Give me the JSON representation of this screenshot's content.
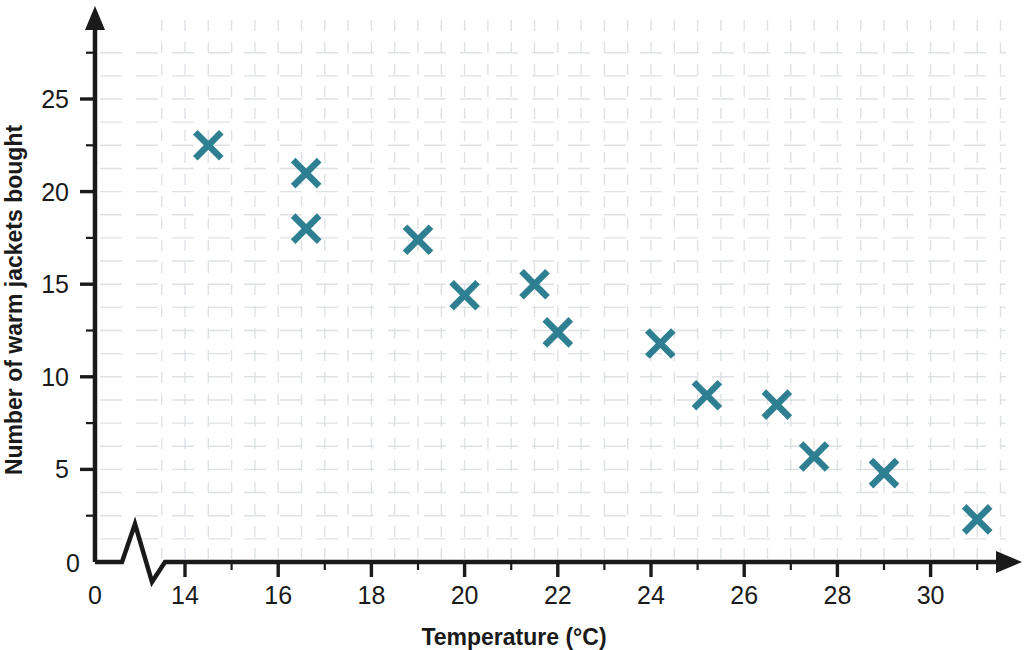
{
  "chart_data": {
    "type": "scatter",
    "title": "",
    "xlabel": "Temperature (°C)",
    "ylabel": "Number of warm jackets bought",
    "xlim": [
      13.0,
      32.0
    ],
    "ylim": [
      0,
      28
    ],
    "x_ticks": [
      14,
      16,
      18,
      20,
      22,
      24,
      26,
      28,
      30
    ],
    "x_tick_labels": [
      "14",
      "16",
      "18",
      "20",
      "22",
      "24",
      "26",
      "28",
      "30"
    ],
    "x_minor_step": 1,
    "y_ticks": [
      0,
      5,
      10,
      15,
      20,
      25
    ],
    "y_tick_labels": [
      "0",
      "5",
      "10",
      "15",
      "20",
      "25"
    ],
    "y_minor_step": 2.5,
    "origin_label": "0",
    "axis_break": true,
    "grid": true,
    "grid_style": "dashed",
    "grid_color": "#d8dde0",
    "marker": "x",
    "marker_color": "#2f7f92",
    "marker_size": 26,
    "axis_color": "#1a1a1a",
    "legend": null,
    "points": [
      {
        "x": 14.5,
        "y": 22.5
      },
      {
        "x": 16.6,
        "y": 21.0
      },
      {
        "x": 16.6,
        "y": 18.0
      },
      {
        "x": 19.0,
        "y": 17.4
      },
      {
        "x": 20.0,
        "y": 14.4
      },
      {
        "x": 21.5,
        "y": 15.0
      },
      {
        "x": 22.0,
        "y": 12.4
      },
      {
        "x": 24.2,
        "y": 11.8
      },
      {
        "x": 25.2,
        "y": 9.0
      },
      {
        "x": 26.7,
        "y": 8.5
      },
      {
        "x": 27.5,
        "y": 5.7
      },
      {
        "x": 29.0,
        "y": 4.8
      },
      {
        "x": 31.0,
        "y": 2.3
      }
    ]
  },
  "axes": {
    "x_axis_name": "temperature-axis",
    "y_axis_name": "jackets-axis"
  }
}
